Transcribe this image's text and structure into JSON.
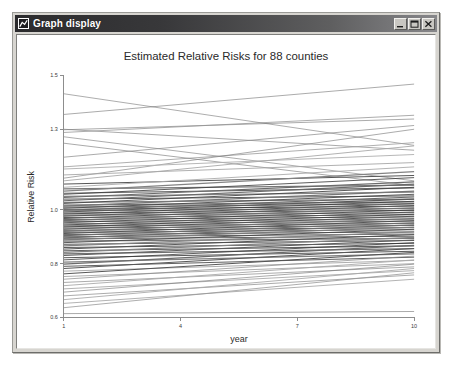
{
  "window": {
    "title": "Graph display",
    "icon": "graph-window-icon",
    "buttons": [
      {
        "name": "minimize",
        "label": "_"
      },
      {
        "name": "maximize",
        "label": "□"
      },
      {
        "name": "close",
        "label": "×"
      }
    ]
  },
  "chart_data": {
    "type": "line",
    "title": "Estimated Relative Risks for 88 counties",
    "xlabel": "year",
    "ylabel": "Relative Risk",
    "xlim": [
      1,
      10
    ],
    "ylim": [
      0.6,
      1.5
    ],
    "xticks": [
      1,
      4,
      7,
      10
    ],
    "xtick_labels": [
      "1",
      "4",
      "7",
      "10"
    ],
    "yticks": [
      0.6,
      0.8,
      1.0,
      1.3,
      1.5
    ],
    "ytick_labels": [
      "0.6",
      "0.8",
      "1.0",
      "1.3",
      "1.5"
    ],
    "grid": false,
    "legend": null,
    "x": [
      1,
      10
    ],
    "n_series": 88,
    "series_note": "88 county trajectories, each a straight line from year 1 to year 10",
    "series": [
      {
        "name": "county-01",
        "values": [
          1.355,
          1.468
        ]
      },
      {
        "name": "county-02",
        "values": [
          1.432,
          1.24
        ]
      },
      {
        "name": "county-03",
        "values": [
          1.298,
          1.338
        ]
      },
      {
        "name": "county-04",
        "values": [
          1.3,
          1.222
        ]
      },
      {
        "name": "county-05",
        "values": [
          1.288,
          1.352
        ]
      },
      {
        "name": "county-06",
        "values": [
          1.272,
          1.108
        ]
      },
      {
        "name": "county-07",
        "values": [
          1.196,
          1.314
        ]
      },
      {
        "name": "county-08",
        "values": [
          1.16,
          1.25
        ]
      },
      {
        "name": "county-09",
        "values": [
          1.118,
          1.3
        ]
      },
      {
        "name": "county-10",
        "values": [
          1.248,
          1.09
        ]
      },
      {
        "name": "county-11",
        "values": [
          1.152,
          1.206
        ]
      },
      {
        "name": "county-12",
        "values": [
          1.13,
          1.176
        ]
      },
      {
        "name": "county-13",
        "values": [
          1.108,
          1.238
        ]
      },
      {
        "name": "county-14",
        "values": [
          1.096,
          1.128
        ]
      },
      {
        "name": "county-15",
        "values": [
          1.084,
          1.16
        ]
      },
      {
        "name": "county-16",
        "values": [
          1.078,
          1.092
        ]
      },
      {
        "name": "county-17",
        "values": [
          1.07,
          1.142
        ]
      },
      {
        "name": "county-18",
        "values": [
          1.062,
          1.082
        ]
      },
      {
        "name": "county-19",
        "values": [
          1.058,
          1.12
        ]
      },
      {
        "name": "county-20",
        "values": [
          1.05,
          1.066
        ]
      },
      {
        "name": "county-21",
        "values": [
          1.046,
          1.104
        ]
      },
      {
        "name": "county-22",
        "values": [
          1.04,
          1.052
        ]
      },
      {
        "name": "county-23",
        "values": [
          1.034,
          1.096
        ]
      },
      {
        "name": "county-24",
        "values": [
          1.028,
          1.04
        ]
      },
      {
        "name": "county-25",
        "values": [
          1.024,
          1.084
        ]
      },
      {
        "name": "county-26",
        "values": [
          1.018,
          1.03
        ]
      },
      {
        "name": "county-27",
        "values": [
          1.014,
          1.07
        ]
      },
      {
        "name": "county-28",
        "values": [
          1.01,
          1.022
        ]
      },
      {
        "name": "county-29",
        "values": [
          1.006,
          1.058
        ]
      },
      {
        "name": "county-30",
        "values": [
          1.002,
          1.014
        ]
      },
      {
        "name": "county-31",
        "values": [
          0.998,
          1.048
        ]
      },
      {
        "name": "county-32",
        "values": [
          0.996,
          1.006
        ]
      },
      {
        "name": "county-33",
        "values": [
          0.992,
          1.04
        ]
      },
      {
        "name": "county-34",
        "values": [
          0.988,
          0.998
        ]
      },
      {
        "name": "county-35",
        "values": [
          0.984,
          1.032
        ]
      },
      {
        "name": "county-36",
        "values": [
          0.98,
          0.99
        ]
      },
      {
        "name": "county-37",
        "values": [
          0.976,
          1.024
        ]
      },
      {
        "name": "county-38",
        "values": [
          0.972,
          0.982
        ]
      },
      {
        "name": "county-39",
        "values": [
          0.968,
          1.016
        ]
      },
      {
        "name": "county-40",
        "values": [
          0.964,
          0.974
        ]
      },
      {
        "name": "county-41",
        "values": [
          0.96,
          1.008
        ]
      },
      {
        "name": "county-42",
        "values": [
          0.956,
          0.966
        ]
      },
      {
        "name": "county-43",
        "values": [
          0.952,
          1.0
        ]
      },
      {
        "name": "county-44",
        "values": [
          0.948,
          0.958
        ]
      },
      {
        "name": "county-45",
        "values": [
          0.944,
          0.992
        ]
      },
      {
        "name": "county-46",
        "values": [
          0.94,
          0.95
        ]
      },
      {
        "name": "county-47",
        "values": [
          0.936,
          0.984
        ]
      },
      {
        "name": "county-48",
        "values": [
          0.932,
          0.942
        ]
      },
      {
        "name": "county-49",
        "values": [
          0.928,
          0.976
        ]
      },
      {
        "name": "county-50",
        "values": [
          0.924,
          0.934
        ]
      },
      {
        "name": "county-51",
        "values": [
          0.92,
          0.968
        ]
      },
      {
        "name": "county-52",
        "values": [
          0.916,
          0.926
        ]
      },
      {
        "name": "county-53",
        "values": [
          0.912,
          0.96
        ]
      },
      {
        "name": "county-54",
        "values": [
          0.908,
          0.918
        ]
      },
      {
        "name": "county-55",
        "values": [
          0.904,
          0.952
        ]
      },
      {
        "name": "county-56",
        "values": [
          0.9,
          0.91
        ]
      },
      {
        "name": "county-57",
        "values": [
          0.896,
          0.944
        ]
      },
      {
        "name": "county-58",
        "values": [
          0.892,
          0.902
        ]
      },
      {
        "name": "county-59",
        "values": [
          0.888,
          0.936
        ]
      },
      {
        "name": "county-60",
        "values": [
          0.884,
          0.894
        ]
      },
      {
        "name": "county-61",
        "values": [
          0.878,
          0.928
        ]
      },
      {
        "name": "county-62",
        "values": [
          0.872,
          0.886
        ]
      },
      {
        "name": "county-63",
        "values": [
          0.866,
          0.918
        ]
      },
      {
        "name": "county-64",
        "values": [
          0.86,
          0.876
        ]
      },
      {
        "name": "county-65",
        "values": [
          0.854,
          0.908
        ]
      },
      {
        "name": "county-66",
        "values": [
          0.848,
          0.866
        ]
      },
      {
        "name": "county-67",
        "values": [
          0.842,
          0.898
        ]
      },
      {
        "name": "county-68",
        "values": [
          0.836,
          0.856
        ]
      },
      {
        "name": "county-69",
        "values": [
          0.83,
          0.888
        ]
      },
      {
        "name": "county-70",
        "values": [
          0.822,
          0.846
        ]
      },
      {
        "name": "county-71",
        "values": [
          0.814,
          0.878
        ]
      },
      {
        "name": "county-72",
        "values": [
          0.806,
          0.836
        ]
      },
      {
        "name": "county-73",
        "values": [
          0.798,
          0.868
        ]
      },
      {
        "name": "county-74",
        "values": [
          0.79,
          0.824
        ]
      },
      {
        "name": "county-75",
        "values": [
          0.782,
          0.856
        ]
      },
      {
        "name": "county-76",
        "values": [
          0.772,
          0.812
        ]
      },
      {
        "name": "county-77",
        "values": [
          0.762,
          0.842
        ]
      },
      {
        "name": "county-78",
        "values": [
          0.752,
          0.8
        ]
      },
      {
        "name": "county-79",
        "values": [
          0.742,
          0.828
        ]
      },
      {
        "name": "county-80",
        "values": [
          0.73,
          0.788
        ]
      },
      {
        "name": "county-81",
        "values": [
          0.718,
          0.814
        ]
      },
      {
        "name": "county-82",
        "values": [
          0.706,
          0.774
        ]
      },
      {
        "name": "county-83",
        "values": [
          0.694,
          0.798
        ]
      },
      {
        "name": "county-84",
        "values": [
          0.68,
          0.758
        ]
      },
      {
        "name": "county-85",
        "values": [
          0.666,
          0.782
        ]
      },
      {
        "name": "county-86",
        "values": [
          0.652,
          0.742
        ]
      },
      {
        "name": "county-87",
        "values": [
          0.636,
          0.766
        ]
      },
      {
        "name": "county-88",
        "values": [
          0.614,
          0.622
        ]
      }
    ]
  }
}
